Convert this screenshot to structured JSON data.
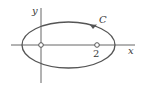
{
  "figure": {
    "x_axis_label": "x",
    "y_axis_label": "y",
    "curve_label": "C",
    "tick_label": "2",
    "points": [
      {
        "name": "origin",
        "x": 0,
        "y": 0,
        "marker": "open-circle"
      },
      {
        "name": "focus-2",
        "x": 2,
        "y": 0,
        "marker": "open-circle"
      }
    ],
    "curve": {
      "type": "ellipse",
      "orientation": "counterclockwise"
    },
    "colors": {
      "stroke": "#555555",
      "background": "#ffffff"
    }
  }
}
